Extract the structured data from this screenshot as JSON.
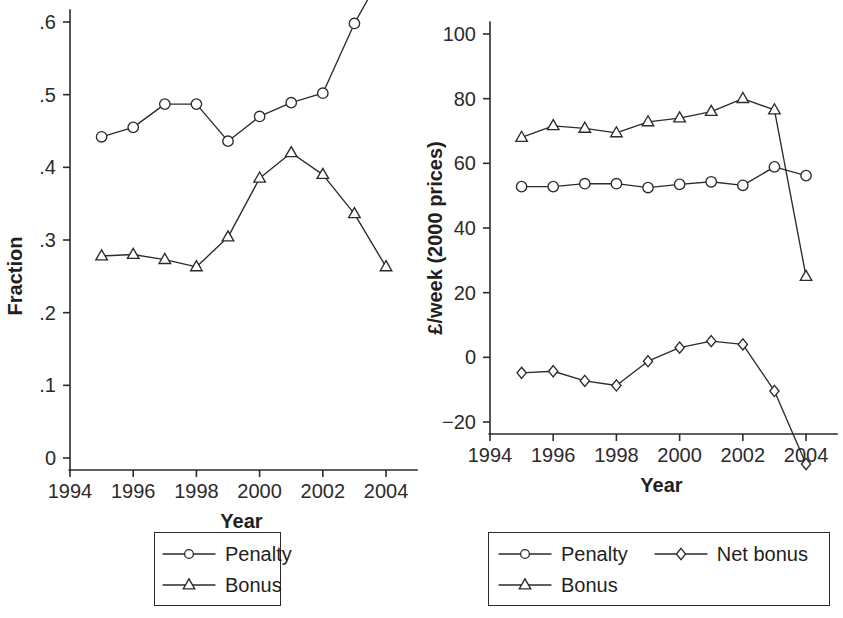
{
  "figure": {
    "background_color": "#ffffff",
    "ink_color": "#2d2a2b",
    "panel_count": 2
  },
  "chart_data": [
    {
      "panel": "left",
      "type": "line",
      "title": "",
      "xlabel": "Year",
      "ylabel": "Fraction",
      "x": [
        1995,
        1996,
        1997,
        1998,
        1999,
        2000,
        2001,
        2002,
        2003,
        2004
      ],
      "xlim": [
        1994,
        2004.6
      ],
      "ylim": [
        0,
        0.69
      ],
      "xticks": [
        1994,
        1996,
        1998,
        2000,
        2002,
        2004
      ],
      "xticklabels": [
        "1994",
        "1996",
        "1998",
        "2000",
        "2002",
        "2004"
      ],
      "yticks": [
        0,
        0.1,
        0.2,
        0.3,
        0.4,
        0.5,
        0.6
      ],
      "yticklabels": [
        "0",
        ".1",
        ".2",
        ".3",
        ".4",
        ".5",
        ".6"
      ],
      "grid": false,
      "legend_position": "below-center",
      "series": [
        {
          "name": "Penalty",
          "marker": "circle",
          "values": [
            0.442,
            0.455,
            0.487,
            0.487,
            0.436,
            0.47,
            0.489,
            0.502,
            0.598,
            0.676
          ]
        },
        {
          "name": "Bonus",
          "marker": "triangle",
          "values": [
            0.278,
            0.28,
            0.273,
            0.263,
            0.304,
            0.385,
            0.42,
            0.39,
            0.336,
            0.263
          ]
        }
      ]
    },
    {
      "panel": "right",
      "type": "line",
      "title": "",
      "xlabel": "Year",
      "ylabel": "£/week (2000 prices)",
      "x": [
        1995,
        1996,
        1997,
        1998,
        1999,
        2000,
        2001,
        2002,
        2003,
        2004
      ],
      "xlim": [
        1994,
        2004.6
      ],
      "ylim": [
        -35,
        106
      ],
      "xticks": [
        1994,
        1996,
        1998,
        2000,
        2002,
        2004
      ],
      "xticklabels": [
        "1994",
        "1996",
        "1998",
        "2000",
        "2002",
        "2004"
      ],
      "yticks": [
        -20,
        0,
        20,
        40,
        60,
        80,
        100
      ],
      "yticklabels": [
        "−20",
        "0",
        "20",
        "40",
        "60",
        "80",
        "100"
      ],
      "grid": false,
      "legend_position": "below-center",
      "series": [
        {
          "name": "Penalty",
          "marker": "circle",
          "values": [
            52.8,
            52.8,
            53.7,
            53.7,
            52.5,
            53.5,
            54.3,
            53.2,
            58.9,
            56.2
          ]
        },
        {
          "name": "Bonus",
          "marker": "triangle",
          "values": [
            68.0,
            71.6,
            70.8,
            69.4,
            72.8,
            74.0,
            76.0,
            80.0,
            76.5,
            25.0
          ]
        },
        {
          "name": "Net bonus",
          "marker": "diamond",
          "values": [
            -4.8,
            -4.3,
            -7.3,
            -8.7,
            -1.2,
            3.0,
            5.0,
            4.0,
            -10.4,
            -33.0
          ]
        }
      ]
    }
  ],
  "legends": {
    "left": {
      "rows": [
        [
          {
            "label": "Penalty",
            "marker": "circle"
          }
        ],
        [
          {
            "label": "Bonus",
            "marker": "triangle"
          }
        ]
      ]
    },
    "right": {
      "rows": [
        [
          {
            "label": "Penalty",
            "marker": "circle"
          },
          {
            "label": "Net bonus",
            "marker": "diamond"
          }
        ],
        [
          {
            "label": "Bonus",
            "marker": "triangle"
          }
        ]
      ]
    }
  }
}
